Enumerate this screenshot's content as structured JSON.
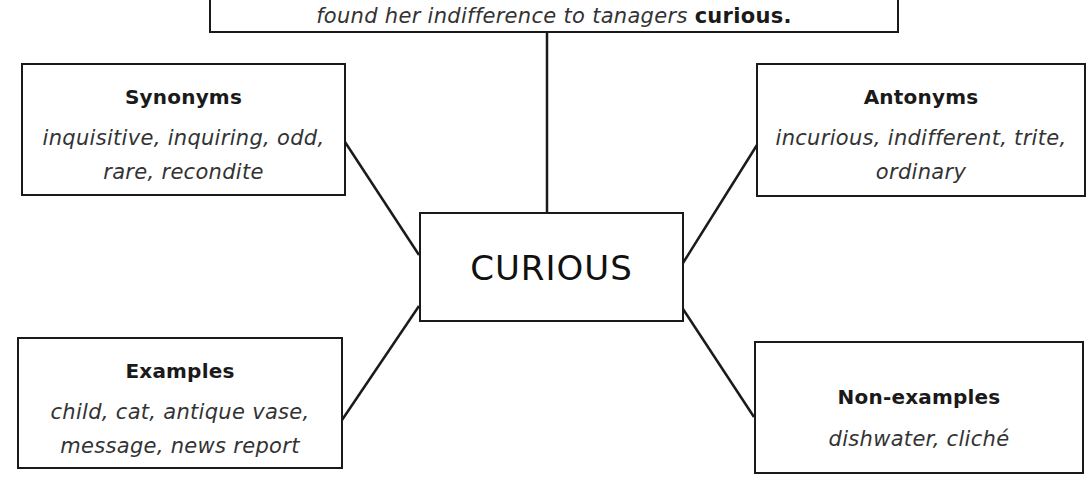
{
  "top_sentence": {
    "text_before": "found her indifference to tanagers ",
    "emphasis": "curious."
  },
  "center": {
    "word": "CURIOUS"
  },
  "boxes": {
    "synonyms": {
      "title": "Synonyms",
      "lines": [
        "inquisitive, inquiring, odd,",
        "rare, recondite"
      ]
    },
    "antonyms": {
      "title": "Antonyms",
      "lines": [
        "incurious, indifferent, trite,",
        "ordinary"
      ]
    },
    "examples": {
      "title": "Examples",
      "lines": [
        "child, cat, antique vase,",
        "message, news report"
      ]
    },
    "non_examples": {
      "title": "Non-examples",
      "lines": [
        "dishwater, cliché"
      ]
    }
  },
  "style": {
    "line_color": "#1a1a1a",
    "background": "#ffffff"
  }
}
